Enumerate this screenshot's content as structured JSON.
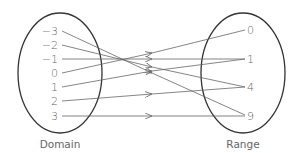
{
  "diagram": {
    "type": "mapping",
    "domain": {
      "caption": "Domain",
      "values": [
        "−3",
        "−2",
        "−1",
        "0",
        "1",
        "2",
        "3"
      ]
    },
    "range": {
      "caption": "Range",
      "values": [
        "0",
        "1",
        "4",
        "9"
      ]
    },
    "mappings": [
      {
        "from": "−3",
        "to": "9"
      },
      {
        "from": "−2",
        "to": "4"
      },
      {
        "from": "−1",
        "to": "1"
      },
      {
        "from": "0",
        "to": "0"
      },
      {
        "from": "1",
        "to": "1"
      },
      {
        "from": "2",
        "to": "4"
      },
      {
        "from": "3",
        "to": "9"
      }
    ],
    "colors": {
      "ellipse": "#333333",
      "arrow": "#666666",
      "text": "#666666"
    }
  }
}
